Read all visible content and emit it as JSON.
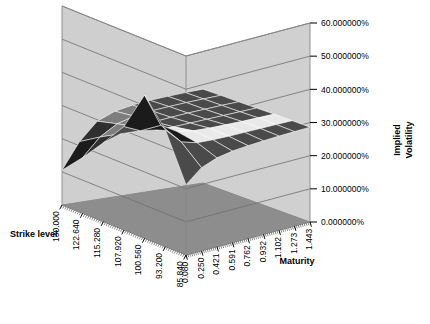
{
  "chart_data": {
    "type": "surface",
    "title": "",
    "zlabel": "Implied Volatility",
    "xlabel": "Strike level",
    "ylabel": "Maturity",
    "zlim": [
      0,
      0.6
    ],
    "ztick_labels": [
      "60.000000%",
      "50.000000%",
      "40.000000%",
      "30.000000%",
      "20.000000%",
      "10.000000%",
      "0.000000%"
    ],
    "ztick_values": [
      0.6,
      0.5,
      0.4,
      0.3,
      0.2,
      0.1,
      0.0
    ],
    "ztick_format": "percent-6dp",
    "strike_tick_labels": [
      "130.000",
      "122.640",
      "115.280",
      "107.920",
      "100.560",
      "93.200",
      "85.840"
    ],
    "strike_tick_values": [
      130.0,
      122.64,
      115.28,
      107.92,
      100.56,
      93.2,
      85.84
    ],
    "maturity_tick_labels": [
      "0.080",
      "0.250",
      "0.421",
      "0.591",
      "0.762",
      "0.932",
      "1.102",
      "1.273",
      "1.443"
    ],
    "maturity_tick_values": [
      0.08,
      0.25,
      0.421,
      0.591,
      0.762,
      0.932,
      1.102,
      1.273,
      1.443
    ],
    "grid": true,
    "legend": "none",
    "surface_style": "wireframe-mesh-greyscale",
    "series": [
      {
        "name": "Implied Volatility Surface",
        "maturities": [
          0.08,
          0.25,
          0.421,
          0.591,
          0.762,
          0.932,
          1.102,
          1.273,
          1.443
        ],
        "strikes": [
          130.0,
          122.64,
          115.28,
          107.92,
          100.56,
          93.2,
          85.84
        ],
        "values": [
          [
            0.105,
            0.183,
            0.236,
            0.258,
            0.268,
            0.274,
            0.278,
            0.281,
            0.283
          ],
          [
            0.168,
            0.221,
            0.252,
            0.266,
            0.273,
            0.277,
            0.28,
            0.282,
            0.284
          ],
          [
            0.238,
            0.255,
            0.266,
            0.272,
            0.276,
            0.279,
            0.281,
            0.283,
            0.284
          ],
          [
            0.312,
            0.289,
            0.281,
            0.28,
            0.281,
            0.282,
            0.283,
            0.284,
            0.285
          ],
          [
            0.432,
            0.33,
            0.3,
            0.291,
            0.288,
            0.287,
            0.286,
            0.286,
            0.286
          ],
          [
            0.352,
            0.304,
            0.29,
            0.287,
            0.286,
            0.286,
            0.286,
            0.286,
            0.286
          ],
          [
            0.212,
            0.251,
            0.268,
            0.276,
            0.28,
            0.282,
            0.284,
            0.285,
            0.286
          ]
        ]
      }
    ]
  },
  "colors": {
    "wall_back": "#d0d0d0",
    "wall_left": "#cfcfcf",
    "floor": "#8d8d8d",
    "gridline": "#6e6e6e",
    "frame": "#888888",
    "mesh_dark": "#1b1b1b",
    "mesh_light": "#f2f2f2",
    "text": "#000000"
  }
}
